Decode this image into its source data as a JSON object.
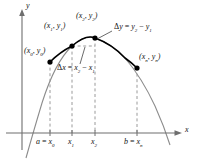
{
  "figure": {
    "type": "cartesian-plot",
    "colors": {
      "curve_highlight": "#000000",
      "curve_light": "#8c8c8c",
      "axis": "#6e6e6e",
      "dashed": "#9a9a9a",
      "point": "#000000",
      "text": "#111111"
    }
  },
  "axes": {
    "x_label": "x",
    "y_label": "y",
    "x_axis_y": 133,
    "y_axis_x": 22,
    "arrows": true
  },
  "points": [
    {
      "name": "p0",
      "label_x": "x",
      "label_x_sub": "0",
      "label_y": "y",
      "label_y_sub": "0",
      "cx": 50,
      "cy": 62
    },
    {
      "name": "p1",
      "label_x": "x",
      "label_x_sub": "1",
      "label_y": "y",
      "label_y_sub": "1",
      "cx": 72,
      "cy": 46
    },
    {
      "name": "p2",
      "label_x": "x",
      "label_x_sub": "2",
      "label_y": "y",
      "label_y_sub": "2",
      "cx": 95,
      "cy": 38
    },
    {
      "name": "pn",
      "label_x": "x",
      "label_x_sub": "n",
      "label_y": "y",
      "label_y_sub": "n",
      "cx": 137,
      "cy": 68
    }
  ],
  "point_labels": {
    "p0": "(x0, y0)",
    "p1": "(x1, y1)",
    "p2": "(x2, y2)",
    "pn": "(xn, yn)"
  },
  "annotations": {
    "delta_y": "Δy = y2 − y1",
    "delta_x": "Δx = x2 − x1",
    "delta_y_parts": {
      "lhs_sym": "Δ",
      "lhs_var": "y",
      "eq": "=",
      "t1": "y",
      "t1sub": "2",
      "minus": "−",
      "t2": "y",
      "t2sub": "1"
    },
    "delta_x_parts": {
      "lhs_sym": "Δ",
      "lhs_var": "x",
      "eq": "=",
      "t1": "x",
      "t1sub": "2",
      "minus": "−",
      "t2": "x",
      "t2sub": "1"
    }
  },
  "x_ticks": [
    {
      "name": "tick-a",
      "text": "a = x0",
      "lead": "a",
      "eq": "=",
      "var": "x",
      "sub": "0",
      "x": 50
    },
    {
      "name": "tick-x1",
      "text": "x1",
      "lead": "",
      "eq": "",
      "var": "x",
      "sub": "1",
      "x": 72
    },
    {
      "name": "tick-x2",
      "text": "x2",
      "lead": "",
      "eq": "",
      "var": "x",
      "sub": "2",
      "x": 95
    },
    {
      "name": "tick-b",
      "text": "b = xn",
      "lead": "b",
      "eq": "=",
      "var": "x",
      "sub": "n",
      "x": 137
    }
  ],
  "curve": {
    "vertex_x": 95,
    "vertex_y": 38,
    "left_root_x": 33,
    "right_root_x": 165,
    "highlight_from_x": 50,
    "highlight_to_x": 137
  }
}
